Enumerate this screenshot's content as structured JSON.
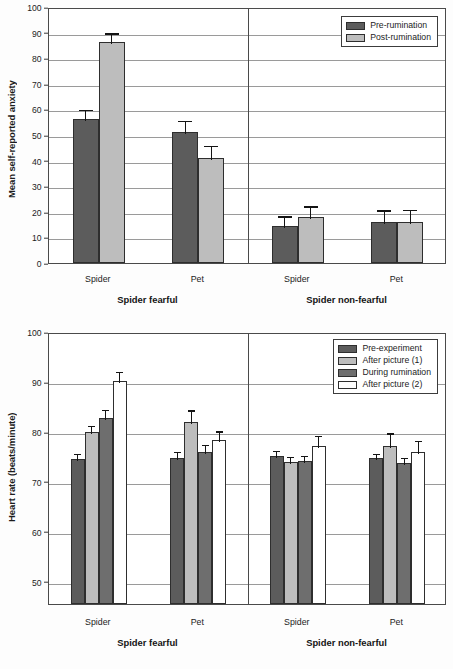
{
  "colors": {
    "dark_gray": "#5c5c5c",
    "light_gray": "#bdbdbd",
    "mid_gray": "#6e6e6e",
    "white": "#ffffff",
    "axis": "#4a4a4a",
    "grid": "#9a9a9a"
  },
  "panels": {
    "left_label": "Spider fearful",
    "right_label": "Spider non-fearful",
    "category_spider": "Spider",
    "category_pet": "Pet"
  },
  "chart_data": [
    {
      "type": "bar",
      "id": "anxiety",
      "title": "",
      "xlabel": "",
      "ylabel": "Mean self-reported anxiety",
      "ylim": [
        0,
        100
      ],
      "ytick_step": 10,
      "yticks": [
        0,
        10,
        20,
        30,
        40,
        50,
        60,
        70,
        80,
        90,
        100
      ],
      "grid": true,
      "legend_position": "top-right",
      "groups": [
        "Spider fearful",
        "Spider non-fearful"
      ],
      "categories": [
        "Spider",
        "Pet",
        "Spider",
        "Pet"
      ],
      "series": [
        {
          "name": "Pre-rumination",
          "color": "#5c5c5c",
          "values": [
            56.1,
            51.2,
            14.5,
            16.1
          ],
          "errors": [
            4.4,
            5.0,
            4.5,
            5.2
          ]
        },
        {
          "name": "Post-rumination",
          "color": "#bdbdbd",
          "values": [
            86.2,
            41.2,
            18.1,
            16.1
          ],
          "errors": [
            4.3,
            5.4,
            4.8,
            5.3
          ]
        }
      ]
    },
    {
      "type": "bar",
      "id": "heartrate",
      "title": "",
      "xlabel": "",
      "ylabel": "Heart rate (beats/minute)",
      "ylim": [
        45.5,
        100
      ],
      "ytick_step": 10,
      "yticks": [
        50,
        60,
        70,
        80,
        90,
        100
      ],
      "grid": true,
      "legend_position": "top-right",
      "groups": [
        "Spider fearful",
        "Spider non-fearful"
      ],
      "categories": [
        "Spider",
        "Pet",
        "Spider",
        "Pet"
      ],
      "series": [
        {
          "name": "Pre-experiment",
          "color": "#5c5c5c",
          "values": [
            74.5,
            74.8,
            75.1,
            74.7
          ],
          "errors": [
            1.4,
            1.5,
            1.4,
            1.3
          ]
        },
        {
          "name": "After picture (1)",
          "color": "#bdbdbd",
          "values": [
            80.0,
            82.0,
            74.0,
            77.1
          ],
          "errors": [
            1.6,
            2.7,
            1.4,
            3.0
          ]
        },
        {
          "name": "During rumination",
          "color": "#6e6e6e",
          "values": [
            82.8,
            76.0,
            74.1,
            73.7
          ],
          "errors": [
            2.0,
            1.7,
            1.4,
            1.5
          ]
        },
        {
          "name": "After picture (2)",
          "color": "#ffffff",
          "values": [
            90.2,
            78.4,
            77.2,
            76.0
          ],
          "errors": [
            2.2,
            2.1,
            2.3,
            2.6
          ]
        }
      ]
    }
  ]
}
